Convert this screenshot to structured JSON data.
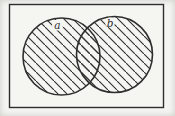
{
  "figure": {
    "type": "venn-diagram",
    "left_circle_label": "a",
    "right_circle_label": "b",
    "colors": {
      "ink": "#2e2e2e",
      "paper": "#f5f5f2"
    }
  }
}
